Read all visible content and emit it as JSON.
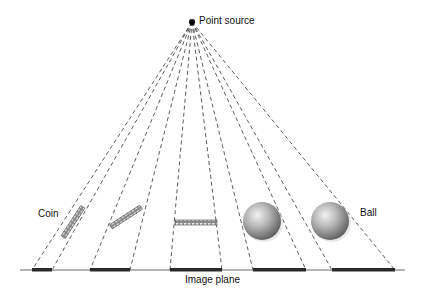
{
  "diagram": {
    "labels": {
      "point_source": "Point source",
      "coin": "Coin",
      "ball": "Ball",
      "image_plane": "Image plane"
    },
    "point_source": {
      "x": 192,
      "y": 22
    },
    "image_plane": {
      "x1": 20,
      "x2": 405,
      "y": 270
    },
    "shadows": [
      {
        "x1": 32,
        "x2": 52
      },
      {
        "x1": 90,
        "x2": 130
      },
      {
        "x1": 170,
        "x2": 222
      },
      {
        "x1": 253,
        "x2": 306
      },
      {
        "x1": 332,
        "x2": 395
      }
    ],
    "objects": [
      {
        "type": "coin",
        "orientation": "steep-tilt"
      },
      {
        "type": "coin",
        "orientation": "shallow-tilt"
      },
      {
        "type": "coin",
        "orientation": "horizontal"
      },
      {
        "type": "ball"
      },
      {
        "type": "ball"
      }
    ],
    "colors": {
      "line": "#222222",
      "shadow": "#2a2a2a",
      "ball": "#9a9a9a"
    }
  }
}
